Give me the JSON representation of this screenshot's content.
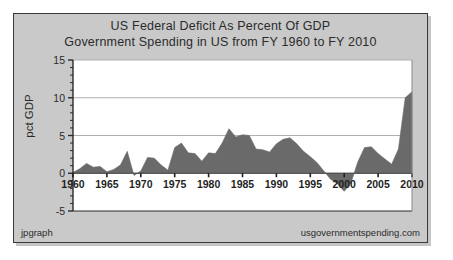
{
  "figure": {
    "title_line_1": "US Federal Deficit As Percent Of GDP",
    "title_line_2": "Government Spending in US from FY 1960 to FY 2010",
    "y_axis_title": "pct GDP",
    "footer_left": "jpgraph",
    "footer_right": "usgovernmentspending.com",
    "panel_color": "#c9c9c9",
    "plot_background": "#ffffff",
    "border_color": "#3a3a3a",
    "series_color": "#6a6a6a",
    "gridline_color": "#b0b0b0"
  },
  "chart_data": {
    "type": "area",
    "title": "US Federal Deficit As Percent Of GDP",
    "subtitle": "Government Spending in US from FY 1960 to FY 2010",
    "xlabel": "",
    "ylabel": "pct GDP",
    "xlim": [
      1960,
      2010
    ],
    "ylim": [
      -5,
      15
    ],
    "yticks": [
      -5,
      0,
      5,
      10,
      15
    ],
    "ytick_labels": [
      "-5",
      "0",
      "5",
      "10",
      "15"
    ],
    "xticks": [
      1960,
      1965,
      1970,
      1975,
      1980,
      1985,
      1990,
      1995,
      2000,
      2005,
      2010
    ],
    "xtick_labels": [
      "1960",
      "1965",
      "1970",
      "1975",
      "1980",
      "1985",
      "1990",
      "1995",
      "2000",
      "2005",
      "2010"
    ],
    "gridlines": "horizontal",
    "legend": "none",
    "series": [
      {
        "name": "US Federal Deficit As Percent Of GDP",
        "color": "#6a6a6a",
        "x": [
          1960,
          1961,
          1962,
          1963,
          1964,
          1965,
          1966,
          1967,
          1968,
          1969,
          1970,
          1971,
          1972,
          1973,
          1974,
          1975,
          1976,
          1977,
          1978,
          1979,
          1980,
          1981,
          1982,
          1983,
          1984,
          1985,
          1986,
          1987,
          1988,
          1989,
          1990,
          1991,
          1992,
          1993,
          1994,
          1995,
          1996,
          1997,
          1998,
          1999,
          2000,
          2001,
          2002,
          2003,
          2004,
          2005,
          2006,
          2007,
          2008,
          2009,
          2010
        ],
        "values": [
          0.1,
          0.6,
          1.3,
          0.8,
          0.9,
          0.2,
          0.5,
          1.1,
          2.9,
          -0.3,
          0.3,
          2.1,
          2.0,
          1.1,
          0.4,
          3.4,
          4.0,
          2.7,
          2.6,
          1.6,
          2.7,
          2.6,
          4.0,
          5.9,
          4.8,
          5.1,
          5.0,
          3.2,
          3.1,
          2.8,
          3.9,
          4.5,
          4.7,
          3.9,
          2.9,
          2.2,
          1.4,
          0.3,
          -0.8,
          -1.4,
          -2.4,
          -1.3,
          1.5,
          3.4,
          3.5,
          2.6,
          1.9,
          1.2,
          3.2,
          10.0,
          10.8
        ]
      }
    ]
  }
}
